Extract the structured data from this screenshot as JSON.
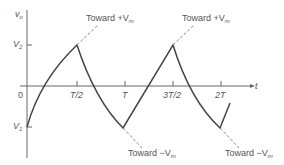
{
  "axes": {
    "y_label": "v",
    "y_label_sub": "o",
    "x_label": "t",
    "origin": "0"
  },
  "y_ticks": [
    {
      "label": "V",
      "sub": "2"
    },
    {
      "label": "V",
      "sub": "1"
    }
  ],
  "x_ticks": [
    "T/2",
    "T",
    "3T/2",
    "2T"
  ],
  "annotations": [
    {
      "text": "Toward +V",
      "sub": "m"
    },
    {
      "text": "Toward +V",
      "sub": "m"
    },
    {
      "text": "Toward −V",
      "sub": "m"
    },
    {
      "text": "Toward −V",
      "sub": "m"
    }
  ],
  "colors": {
    "curve": "#444444",
    "axis": "#666666",
    "dashed": "#888888"
  }
}
